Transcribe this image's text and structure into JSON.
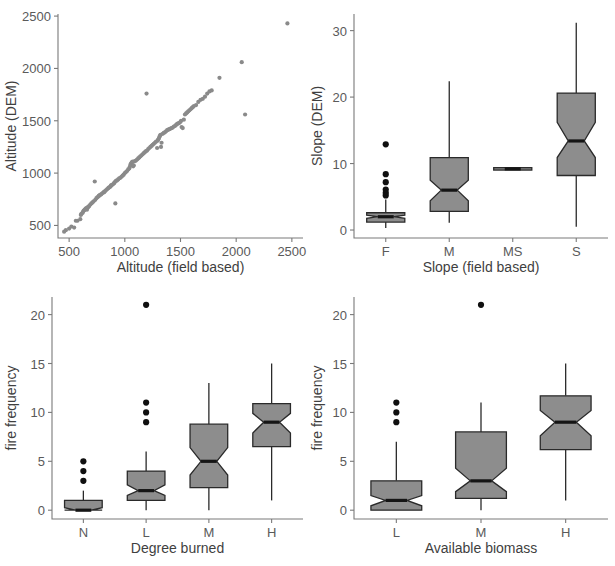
{
  "figure": {
    "title": "",
    "background": "#ffffff",
    "panel_count": 4,
    "colors": {
      "point": "#8a8a8a",
      "box_fill": "#8d8d8d",
      "box_stroke": "#2a2a2a",
      "median": "#151515",
      "outlier": "#101010",
      "axis": "#7a7a7a",
      "text": "#5a5a5a"
    }
  },
  "chart_data": [
    {
      "type": "scatter",
      "panel": "top-left",
      "title": "",
      "xlabel": "Altitude (field based)",
      "ylabel": "Altitude (DEM)",
      "xlim": [
        400,
        2600
      ],
      "ylim": [
        380,
        2520
      ],
      "xticks": [
        500,
        1000,
        1500,
        2000,
        2500
      ],
      "yticks": [
        500,
        1000,
        1500,
        2000,
        2500
      ],
      "grid": false,
      "legend": null,
      "marker": "filled-circle",
      "points": [
        [
          455,
          440
        ],
        [
          470,
          455
        ],
        [
          500,
          470
        ],
        [
          520,
          490
        ],
        [
          545,
          480
        ],
        [
          560,
          545
        ],
        [
          575,
          545
        ],
        [
          600,
          560
        ],
        [
          605,
          600
        ],
        [
          610,
          610
        ],
        [
          620,
          620
        ],
        [
          625,
          630
        ],
        [
          630,
          640
        ],
        [
          635,
          645
        ],
        [
          640,
          650
        ],
        [
          645,
          655
        ],
        [
          650,
          660
        ],
        [
          655,
          665
        ],
        [
          660,
          650
        ],
        [
          665,
          670
        ],
        [
          670,
          675
        ],
        [
          675,
          680
        ],
        [
          680,
          685
        ],
        [
          690,
          700
        ],
        [
          700,
          710
        ],
        [
          710,
          720
        ],
        [
          720,
          730
        ],
        [
          730,
          920
        ],
        [
          735,
          745
        ],
        [
          745,
          760
        ],
        [
          755,
          770
        ],
        [
          765,
          780
        ],
        [
          770,
          785
        ],
        [
          775,
          790
        ],
        [
          785,
          795
        ],
        [
          790,
          800
        ],
        [
          800,
          810
        ],
        [
          810,
          815
        ],
        [
          815,
          820
        ],
        [
          820,
          825
        ],
        [
          830,
          835
        ],
        [
          840,
          845
        ],
        [
          850,
          855
        ],
        [
          855,
          860
        ],
        [
          860,
          865
        ],
        [
          870,
          870
        ],
        [
          875,
          880
        ],
        [
          880,
          885
        ],
        [
          890,
          890
        ],
        [
          900,
          900
        ],
        [
          905,
          905
        ],
        [
          910,
          915
        ],
        [
          915,
          710
        ],
        [
          920,
          925
        ],
        [
          930,
          930
        ],
        [
          940,
          940
        ],
        [
          950,
          950
        ],
        [
          960,
          955
        ],
        [
          970,
          965
        ],
        [
          980,
          975
        ],
        [
          990,
          985
        ],
        [
          1000,
          1000
        ],
        [
          1010,
          1010
        ],
        [
          1020,
          1020
        ],
        [
          1030,
          1035
        ],
        [
          1040,
          1045
        ],
        [
          1045,
          1060
        ],
        [
          1050,
          1080
        ],
        [
          1055,
          1090
        ],
        [
          1060,
          1095
        ],
        [
          1065,
          1105
        ],
        [
          1070,
          1110
        ],
        [
          1075,
          1065
        ],
        [
          1080,
          1075
        ],
        [
          1090,
          1115
        ],
        [
          1100,
          1120
        ],
        [
          1110,
          1130
        ],
        [
          1120,
          1140
        ],
        [
          1130,
          1150
        ],
        [
          1140,
          1160
        ],
        [
          1150,
          1170
        ],
        [
          1160,
          1180
        ],
        [
          1170,
          1190
        ],
        [
          1180,
          1200
        ],
        [
          1190,
          1210
        ],
        [
          1195,
          1760
        ],
        [
          1200,
          1215
        ],
        [
          1210,
          1230
        ],
        [
          1220,
          1240
        ],
        [
          1230,
          1250
        ],
        [
          1240,
          1260
        ],
        [
          1250,
          1270
        ],
        [
          1260,
          1280
        ],
        [
          1270,
          1290
        ],
        [
          1280,
          1300
        ],
        [
          1290,
          1240
        ],
        [
          1295,
          1310
        ],
        [
          1300,
          1320
        ],
        [
          1305,
          1330
        ],
        [
          1310,
          1345
        ],
        [
          1315,
          1355
        ],
        [
          1320,
          1365
        ],
        [
          1325,
          1250
        ],
        [
          1330,
          1290
        ],
        [
          1340,
          1375
        ],
        [
          1350,
          1385
        ],
        [
          1360,
          1390
        ],
        [
          1370,
          1400
        ],
        [
          1380,
          1410
        ],
        [
          1390,
          1415
        ],
        [
          1400,
          1420
        ],
        [
          1410,
          1425
        ],
        [
          1420,
          1430
        ],
        [
          1430,
          1435
        ],
        [
          1440,
          1445
        ],
        [
          1450,
          1450
        ],
        [
          1460,
          1460
        ],
        [
          1470,
          1470
        ],
        [
          1480,
          1475
        ],
        [
          1490,
          1480
        ],
        [
          1500,
          1490
        ],
        [
          1505,
          1500
        ],
        [
          1510,
          1440
        ],
        [
          1520,
          1430
        ],
        [
          1530,
          1510
        ],
        [
          1540,
          1560
        ],
        [
          1550,
          1570
        ],
        [
          1560,
          1580
        ],
        [
          1570,
          1590
        ],
        [
          1580,
          1600
        ],
        [
          1590,
          1610
        ],
        [
          1600,
          1620
        ],
        [
          1610,
          1630
        ],
        [
          1620,
          1640
        ],
        [
          1640,
          1650
        ],
        [
          1660,
          1680
        ],
        [
          1680,
          1700
        ],
        [
          1700,
          1710
        ],
        [
          1720,
          1730
        ],
        [
          1740,
          1760
        ],
        [
          1760,
          1780
        ],
        [
          1780,
          1790
        ],
        [
          1850,
          1910
        ],
        [
          2050,
          2060
        ],
        [
          2080,
          1560
        ],
        [
          2460,
          2430
        ]
      ]
    },
    {
      "type": "boxplot",
      "panel": "top-right",
      "title": "",
      "xlabel": "Slope (field based)",
      "ylabel": "Slope (DEM)",
      "ylim": [
        -1.2,
        32.5
      ],
      "yticks": [
        0,
        10,
        20,
        30
      ],
      "notched": true,
      "grid": false,
      "legend": null,
      "categories": [
        "F",
        "M",
        "MS",
        "S"
      ],
      "boxes": [
        {
          "category": "F",
          "whisker_low": 0.3,
          "q1": 1.2,
          "median": 2.0,
          "q3": 2.6,
          "whisker_high": 4.6,
          "notch_low": 1.75,
          "notch_high": 2.25,
          "outliers": [
            5.2,
            5.6,
            6.1,
            7.2,
            8.4,
            12.9
          ]
        },
        {
          "category": "M",
          "whisker_low": 1.1,
          "q1": 2.8,
          "median": 6.0,
          "q3": 10.9,
          "whisker_high": 22.4,
          "notch_low": 4.4,
          "notch_high": 7.5,
          "outliers": []
        },
        {
          "category": "MS",
          "whisker_low": 9.2,
          "q1": 9.2,
          "median": 9.2,
          "q3": 9.2,
          "whisker_high": 9.2,
          "notch_low": 9.2,
          "notch_high": 9.2,
          "outliers": []
        },
        {
          "category": "S",
          "whisker_low": 0.5,
          "q1": 8.2,
          "median": 13.4,
          "q3": 20.6,
          "whisker_high": 31.2,
          "notch_low": 10.9,
          "notch_high": 16.2,
          "outliers": []
        }
      ]
    },
    {
      "type": "boxplot",
      "panel": "bottom-left",
      "title": "",
      "xlabel": "Degree burned",
      "ylabel": "fire frequency",
      "ylim": [
        -0.9,
        21.8
      ],
      "yticks": [
        0,
        5,
        10,
        15,
        20
      ],
      "notched": true,
      "grid": false,
      "legend": null,
      "categories": [
        "N",
        "L",
        "M",
        "H"
      ],
      "boxes": [
        {
          "category": "N",
          "whisker_low": 0.0,
          "q1": 0.0,
          "median": 0.0,
          "q3": 1.0,
          "whisker_high": 2.0,
          "notch_low": 0.0,
          "notch_high": 0.25,
          "outliers": [
            3.0,
            4.0,
            5.0
          ]
        },
        {
          "category": "L",
          "whisker_low": 0.0,
          "q1": 1.0,
          "median": 2.0,
          "q3": 4.0,
          "whisker_high": 6.0,
          "notch_low": 1.5,
          "notch_high": 2.6,
          "outliers": [
            9.0,
            10.0,
            11.0,
            21.0
          ]
        },
        {
          "category": "M",
          "whisker_low": 0.0,
          "q1": 2.3,
          "median": 5.0,
          "q3": 8.8,
          "whisker_high": 13.0,
          "notch_low": 3.6,
          "notch_high": 6.4,
          "outliers": []
        },
        {
          "category": "H",
          "whisker_low": 1.0,
          "q1": 6.5,
          "median": 9.0,
          "q3": 10.9,
          "whisker_high": 15.0,
          "notch_low": 7.9,
          "notch_high": 9.9,
          "outliers": []
        }
      ]
    },
    {
      "type": "boxplot",
      "panel": "bottom-right",
      "title": "",
      "xlabel": "Available biomass",
      "ylabel": "fire frequency",
      "ylim": [
        -0.9,
        21.8
      ],
      "yticks": [
        0,
        5,
        10,
        15,
        20
      ],
      "notched": true,
      "grid": false,
      "legend": null,
      "categories": [
        "L",
        "M",
        "H"
      ],
      "boxes": [
        {
          "category": "L",
          "whisker_low": 0.0,
          "q1": 0.0,
          "median": 1.0,
          "q3": 3.0,
          "whisker_high": 7.0,
          "notch_low": 0.45,
          "notch_high": 1.5,
          "outliers": [
            9.0,
            10.0,
            11.0
          ]
        },
        {
          "category": "M",
          "whisker_low": 0.0,
          "q1": 1.2,
          "median": 3.0,
          "q3": 8.0,
          "whisker_high": 11.0,
          "notch_low": 1.9,
          "notch_high": 4.3,
          "outliers": [
            21.0
          ]
        },
        {
          "category": "H",
          "whisker_low": 1.0,
          "q1": 6.2,
          "median": 9.0,
          "q3": 11.7,
          "whisker_high": 15.0,
          "notch_low": 7.6,
          "notch_high": 10.2,
          "outliers": []
        }
      ]
    }
  ]
}
